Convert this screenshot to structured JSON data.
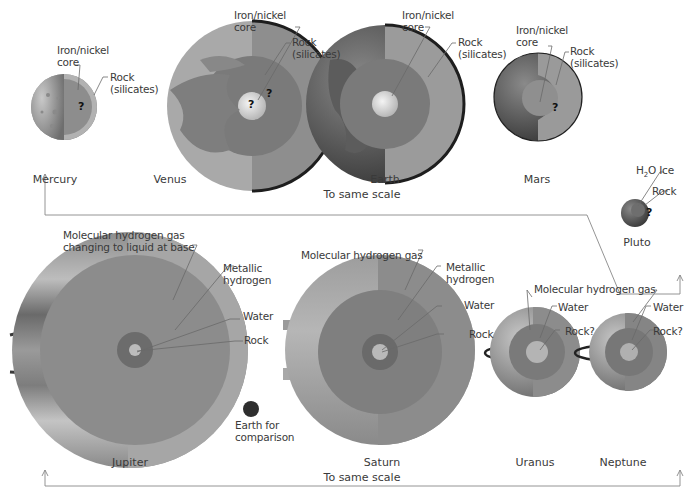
{
  "terrestrial_group": {
    "scale_label": "To same scale",
    "planets": [
      {
        "name": "Mercury",
        "labels": [
          "Iron/nickel core",
          "Rock (silicates)"
        ],
        "unknown_marker": "?"
      },
      {
        "name": "Venus",
        "labels": [
          "Iron/nickel core",
          "Rock (silicates)"
        ],
        "unknown_marker": "?"
      },
      {
        "name": "Earth",
        "labels": [
          "Iron/nickel core",
          "Rock (silicates)"
        ]
      },
      {
        "name": "Mars",
        "labels": [
          "Iron/nickel core",
          "Rock (silicates)"
        ],
        "unknown_marker": "?"
      }
    ]
  },
  "pluto": {
    "name": "Pluto",
    "labels": [
      "H2O Ice",
      "Rock"
    ],
    "unknown_marker": "?"
  },
  "giant_group": {
    "scale_label": "To same scale",
    "planets": [
      {
        "name": "Jupiter",
        "labels": [
          "Molecular hydrogen gas changing to liquid at base",
          "Metallic hydrogen",
          "Water",
          "Rock"
        ]
      },
      {
        "name": "Saturn",
        "labels": [
          "Molecular hydrogen gas",
          "Metallic hydrogen",
          "Water",
          "Rock"
        ]
      },
      {
        "name": "Uranus",
        "labels": [
          "Molecular hydrogen gas",
          "Water",
          "Rock?"
        ]
      },
      {
        "name": "Neptune",
        "labels": [
          "Molecular hydrogen gas",
          "Water",
          "Rock?"
        ]
      }
    ],
    "earth_comparison_label": "Earth for comparison"
  },
  "text": {
    "iron_line1": "Iron/nickel",
    "iron_line2": "core",
    "rock_line1": "Rock",
    "rock_line2": "(silicates)",
    "q": "?",
    "mercury": "Mercury",
    "venus": "Venus",
    "earth": "Earth",
    "mars": "Mars",
    "pluto": "Pluto",
    "scale_top": "To same scale",
    "scale_bottom": "To same scale",
    "h2o": "H",
    "h2o_sub": "2",
    "h2o_rest": "O Ice",
    "rock": "Rock",
    "rockq": "Rock?",
    "jup_gas_1": "Molecular hydrogen gas",
    "jup_gas_2": "changing to liquid at base",
    "metallic_1": "Metallic",
    "metallic_2": "hydrogen",
    "water": "Water",
    "mol_gas": "Molecular hydrogen gas",
    "earth_cmp_1": "Earth for",
    "earth_cmp_2": "comparison",
    "jupiter": "Jupiter",
    "saturn": "Saturn",
    "uranus": "Uranus",
    "neptune": "Neptune"
  },
  "colors": {
    "background": "#ffffff",
    "line": "#8a8a8a",
    "text": "#3a3a3a"
  }
}
